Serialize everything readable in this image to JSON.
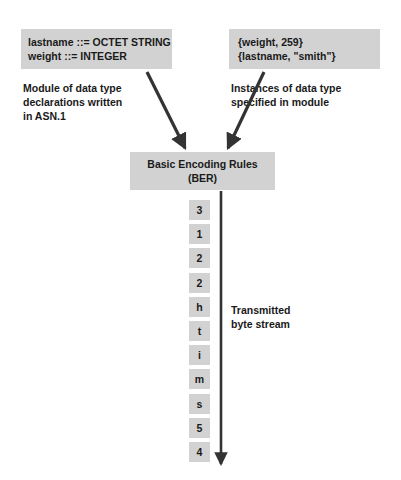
{
  "diagram": {
    "declaration_box": {
      "lines": [
        "lastname ::= OCTET STRING",
        "weight ::= INTEGER"
      ]
    },
    "instance_box": {
      "lines": [
        "{weight, 259}",
        "{lastname, \"smith\"}"
      ]
    },
    "captions": {
      "left": [
        "Module of data type",
        "declarations written",
        "in ASN.1"
      ],
      "right": [
        "Instances of data type",
        "specified in module"
      ],
      "stream": [
        "Transmitted",
        "byte stream"
      ]
    },
    "encoder_box": {
      "line1": "Basic Encoding Rules",
      "line2": "(BER)"
    },
    "byte_stream": [
      "3",
      "1",
      "2",
      "2",
      "h",
      "t",
      "i",
      "m",
      "s",
      "5",
      "4"
    ],
    "colors": {
      "box_fill": "#d2d2d2",
      "text": "#1a1a1a",
      "arrow": "#333333",
      "background": "#ffffff"
    }
  }
}
